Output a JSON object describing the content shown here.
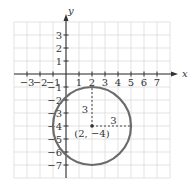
{
  "chart_data": {
    "type": "scatter",
    "title": "",
    "xlabel": "x",
    "ylabel": "y",
    "xlim": [
      -4,
      8
    ],
    "ylim": [
      -8,
      4
    ],
    "grid": true,
    "x_ticks": [
      "-3",
      "-2",
      "-1",
      "1",
      "2",
      "3",
      "4",
      "5",
      "6",
      "7"
    ],
    "y_ticks": [
      "3",
      "2",
      "1",
      "-1",
      "-2",
      "-3",
      "-4",
      "-5",
      "-6",
      "-7"
    ],
    "circle": {
      "center": [
        2,
        -4
      ],
      "radius": 3
    },
    "annotations": [
      {
        "text": "(2, −4)",
        "x": 2,
        "y": -4,
        "role": "center-label"
      },
      {
        "text": "3",
        "role": "vertical-radius-label"
      },
      {
        "text": "3",
        "role": "horizontal-radius-label"
      }
    ],
    "colors": {
      "circle": "#6b6b6b",
      "grid": "#dcdcdc",
      "axis": "#333333"
    }
  }
}
